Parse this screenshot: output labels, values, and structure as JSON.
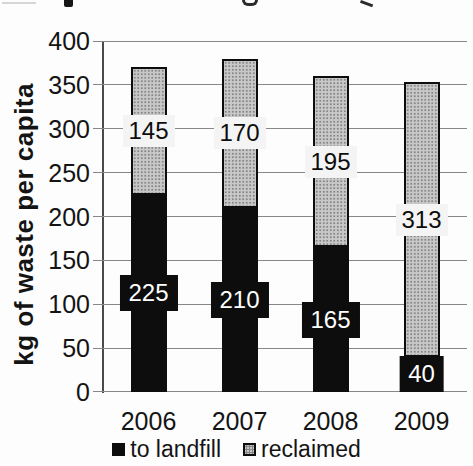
{
  "chart_data": {
    "type": "bar",
    "stacked": true,
    "categories": [
      "2006",
      "2007",
      "2008",
      "2009"
    ],
    "series": [
      {
        "name": "to landfill",
        "color": "#0d0d0d",
        "values": [
          225,
          210,
          165,
          40
        ],
        "label_style": "white-on-black"
      },
      {
        "name": "reclaimed",
        "color": "#c8c8c8",
        "values": [
          145,
          170,
          195,
          313
        ],
        "label_style": "black-on-white"
      }
    ],
    "ylabel": "kg of waste per capita",
    "xlabel": "",
    "ylim": [
      0,
      400
    ],
    "yticks": [
      0,
      50,
      100,
      150,
      200,
      250,
      300,
      350,
      400
    ],
    "grid": true,
    "legend_position": "bottom",
    "legend": [
      "to landfill",
      "reclaimed"
    ],
    "colors": {
      "landfill_fill": "#0d0d0d",
      "reclaimed_fill": "#c8c8c8",
      "gridline": "#878787",
      "background": "#fdfdfd"
    }
  }
}
